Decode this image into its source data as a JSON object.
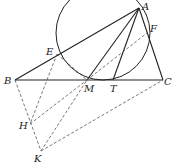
{
  "diagram": {
    "type": "geometry",
    "points": {
      "A": {
        "label": "A",
        "x": 139,
        "y": 8
      },
      "B": {
        "label": "B",
        "x": 15,
        "y": 80
      },
      "C": {
        "label": "C",
        "x": 163,
        "y": 80
      },
      "E": {
        "label": "E",
        "x": 57,
        "y": 54
      },
      "F": {
        "label": "F",
        "x": 147,
        "y": 33
      },
      "M": {
        "label": "M",
        "x": 87,
        "y": 80
      },
      "T": {
        "label": "T",
        "x": 113,
        "y": 80
      },
      "H": {
        "label": "H",
        "x": 30,
        "y": 124
      },
      "K": {
        "label": "K",
        "x": 41,
        "y": 151
      }
    },
    "circle": {
      "cx": 103,
      "cy": 33,
      "r": 47
    },
    "solid_segments": [
      "AB",
      "AC",
      "BC",
      "AM",
      "AT"
    ],
    "dashed_segments": [
      "EM",
      "MF",
      "EH",
      "BK",
      "HM",
      "KM",
      "KC"
    ],
    "colors": {
      "stroke": "#222222",
      "background": "#ffffff"
    }
  }
}
